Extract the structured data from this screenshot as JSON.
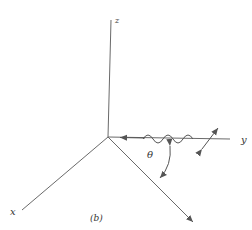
{
  "diagram": {
    "axes": {
      "z_label": "z",
      "y_label": "y",
      "x_label": "x"
    },
    "angle_label": "θ",
    "caption": "(b)",
    "colors": {
      "line": "#6a6a6a",
      "text": "#333333",
      "background": "#ffffff"
    }
  }
}
